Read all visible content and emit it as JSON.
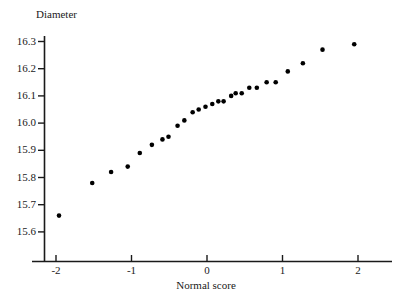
{
  "chart_data": {
    "type": "scatter",
    "title": "",
    "xlabel": "Normal score",
    "ylabel": "Diameter",
    "xlim": [
      -2.35,
      2.3
    ],
    "ylim": [
      15.6,
      16.33
    ],
    "xticks": [
      -2,
      -1,
      0,
      1,
      2
    ],
    "xtick_labels": [
      "-2",
      "-1",
      "0",
      "1",
      "2"
    ],
    "yticks": [
      15.6,
      15.7,
      15.8,
      15.9,
      16.0,
      16.1,
      16.2,
      16.3
    ],
    "ytick_labels": [
      "15.6",
      "15.7",
      "15.8",
      "15.9",
      "16.0",
      "16.1",
      "16.2",
      "16.3"
    ],
    "grid": false,
    "legend": false,
    "marker": "filled-circle",
    "marker_color": "#000000",
    "marker_size_px": 4.6,
    "axis_color": "#1a1a1a",
    "background": "#ffffff",
    "x": [
      -1.96,
      -1.52,
      -1.27,
      -1.05,
      -0.87,
      -0.73,
      -0.59,
      -0.51,
      -0.39,
      -0.3,
      -0.2,
      -0.12,
      -0.02,
      0.08,
      0.15,
      0.22,
      0.32,
      0.39,
      0.46,
      0.58,
      0.68,
      0.79,
      0.91,
      1.08,
      1.27,
      1.53,
      1.95
    ],
    "y": [
      15.66,
      15.78,
      15.82,
      15.84,
      15.89,
      15.92,
      15.94,
      15.95,
      15.99,
      16.01,
      16.04,
      16.05,
      16.06,
      16.07,
      16.08,
      16.1,
      16.11,
      16.13,
      16.13,
      16.15,
      16.15,
      16.19,
      16.22,
      16.27,
      16.29,
      16.27,
      16.29
    ],
    "points": [
      {
        "x": -1.96,
        "y": 15.66
      },
      {
        "x": -1.52,
        "y": 15.78
      },
      {
        "x": -1.27,
        "y": 15.82
      },
      {
        "x": -1.05,
        "y": 15.84
      },
      {
        "x": -0.89,
        "y": 15.89
      },
      {
        "x": -0.73,
        "y": 15.92
      },
      {
        "x": -0.59,
        "y": 15.94
      },
      {
        "x": -0.51,
        "y": 15.95
      },
      {
        "x": -0.39,
        "y": 15.99
      },
      {
        "x": -0.3,
        "y": 16.01
      },
      {
        "x": -0.19,
        "y": 16.04
      },
      {
        "x": -0.11,
        "y": 16.05
      },
      {
        "x": -0.02,
        "y": 16.06
      },
      {
        "x": 0.07,
        "y": 16.07
      },
      {
        "x": 0.15,
        "y": 16.08
      },
      {
        "x": 0.22,
        "y": 16.08
      },
      {
        "x": 0.32,
        "y": 16.1
      },
      {
        "x": 0.38,
        "y": 16.11
      },
      {
        "x": 0.46,
        "y": 16.11
      },
      {
        "x": 0.56,
        "y": 16.13
      },
      {
        "x": 0.66,
        "y": 16.13
      },
      {
        "x": 0.79,
        "y": 16.15
      },
      {
        "x": 0.91,
        "y": 16.15
      },
      {
        "x": 1.07,
        "y": 16.19
      },
      {
        "x": 1.27,
        "y": 16.22
      },
      {
        "x": 1.53,
        "y": 16.27
      },
      {
        "x": 1.95,
        "y": 16.29
      }
    ]
  }
}
